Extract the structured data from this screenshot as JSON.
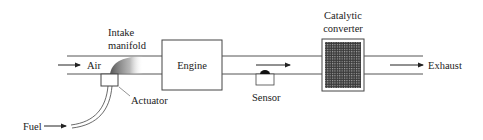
{
  "diagram": {
    "type": "engine-control-schematic",
    "colors": {
      "line": "#444444",
      "text": "#222222",
      "mesh": "#3a3a3a",
      "background": "#ffffff"
    },
    "labels": {
      "air": "Air",
      "intake_manifold_line1": "Intake",
      "intake_manifold_line2": "manifold",
      "engine": "Engine",
      "actuator": "Actuator",
      "fuel": "Fuel",
      "sensor": "Sensor",
      "catalytic_line1": "Catalytic",
      "catalytic_line2": "converter",
      "exhaust": "Exhaust"
    },
    "components": [
      {
        "id": "intake-manifold",
        "label": "Intake manifold"
      },
      {
        "id": "actuator",
        "label": "Actuator"
      },
      {
        "id": "engine",
        "label": "Engine"
      },
      {
        "id": "sensor",
        "label": "Sensor"
      },
      {
        "id": "catalytic-converter",
        "label": "Catalytic converter"
      }
    ],
    "flows": [
      {
        "from": "Air",
        "to": "intake-manifold"
      },
      {
        "from": "Fuel",
        "to": "actuator"
      },
      {
        "from": "engine",
        "to": "catalytic-converter"
      },
      {
        "from": "catalytic-converter",
        "to": "Exhaust"
      }
    ]
  }
}
